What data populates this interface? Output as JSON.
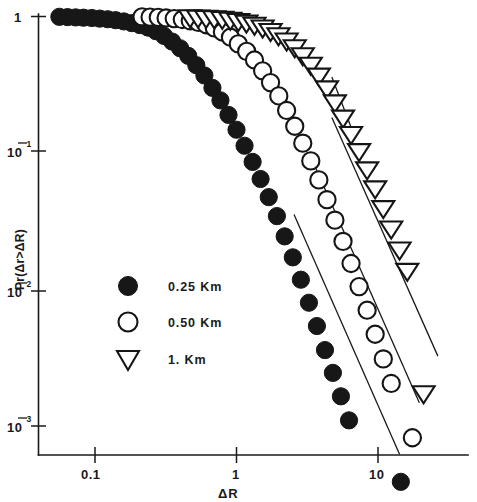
{
  "chart_data": {
    "type": "scatter",
    "title": "",
    "subtitle": "",
    "xlabel": "ΔR",
    "ylabel": "Pr(Δr>ΔR)",
    "xscale": "log",
    "yscale": "log",
    "xlim": [
      0.05,
      30
    ],
    "ylim": [
      0.001,
      1.2
    ],
    "xticks": [
      0.1,
      1,
      10
    ],
    "xtick_labels": [
      "0.1",
      "1",
      "10"
    ],
    "yticks": [
      1,
      0.1,
      0.01,
      0.001
    ],
    "ytick_labels": [
      "1",
      "10⁻¹",
      "10⁻²",
      "10⁻³"
    ],
    "ytick_bases": [
      "1",
      "10",
      "10",
      "10"
    ],
    "ytick_exponents": [
      "",
      "-1",
      "-2",
      "-3"
    ],
    "grid": false,
    "legend_position": "center-left",
    "legend": [
      "0.25 Km",
      "0.50 Km",
      "1. Km"
    ],
    "series": [
      {
        "name": "0.25 Km",
        "marker": "filled-circle",
        "color": "#171717",
        "points": [
          [
            0.056,
            0.995
          ],
          [
            0.064,
            0.99
          ],
          [
            0.073,
            0.985
          ],
          [
            0.083,
            0.98
          ],
          [
            0.095,
            0.975
          ],
          [
            0.108,
            0.965
          ],
          [
            0.123,
            0.955
          ],
          [
            0.14,
            0.94
          ],
          [
            0.16,
            0.92
          ],
          [
            0.182,
            0.895
          ],
          [
            0.208,
            0.865
          ],
          [
            0.237,
            0.83
          ],
          [
            0.27,
            0.78
          ],
          [
            0.308,
            0.72
          ],
          [
            0.351,
            0.655
          ],
          [
            0.4,
            0.585
          ],
          [
            0.456,
            0.515
          ],
          [
            0.52,
            0.44
          ],
          [
            0.593,
            0.37
          ],
          [
            0.676,
            0.3
          ],
          [
            0.77,
            0.243
          ],
          [
            0.878,
            0.19
          ],
          [
            1.0,
            0.148
          ],
          [
            1.14,
            0.113
          ],
          [
            1.3,
            0.086
          ],
          [
            1.48,
            0.0645
          ],
          [
            1.69,
            0.0475
          ],
          [
            1.93,
            0.0345
          ],
          [
            2.19,
            0.0245
          ],
          [
            2.5,
            0.0172
          ],
          [
            2.85,
            0.0118
          ],
          [
            3.25,
            0.008
          ],
          [
            3.7,
            0.0054
          ],
          [
            4.22,
            0.0036
          ],
          [
            4.8,
            0.00245
          ],
          [
            5.47,
            0.00165
          ],
          [
            6.24,
            0.0011
          ],
          [
            14.5,
            0.00039
          ]
        ]
      },
      {
        "name": "0.50 Km",
        "marker": "open-circle",
        "color": "#151515",
        "points": [
          [
            0.215,
            0.995
          ],
          [
            0.245,
            0.99
          ],
          [
            0.28,
            0.985
          ],
          [
            0.318,
            0.975
          ],
          [
            0.363,
            0.965
          ],
          [
            0.414,
            0.95
          ],
          [
            0.471,
            0.93
          ],
          [
            0.537,
            0.905
          ],
          [
            0.612,
            0.87
          ],
          [
            0.697,
            0.825
          ],
          [
            0.795,
            0.77
          ],
          [
            0.906,
            0.705
          ],
          [
            1.03,
            0.63
          ],
          [
            1.18,
            0.555
          ],
          [
            1.34,
            0.48
          ],
          [
            1.53,
            0.4
          ],
          [
            1.74,
            0.328
          ],
          [
            1.99,
            0.262
          ],
          [
            2.26,
            0.205
          ],
          [
            2.58,
            0.157
          ],
          [
            2.94,
            0.118
          ],
          [
            3.35,
            0.0875
          ],
          [
            3.82,
            0.0635
          ],
          [
            4.36,
            0.0455
          ],
          [
            4.96,
            0.0322
          ],
          [
            5.66,
            0.0225
          ],
          [
            6.45,
            0.0155
          ],
          [
            7.35,
            0.0105
          ],
          [
            8.38,
            0.00705
          ],
          [
            9.55,
            0.0047
          ],
          [
            10.9,
            0.0031
          ],
          [
            12.4,
            0.00205
          ],
          [
            17.5,
            0.00082
          ]
        ]
      },
      {
        "name": "1. Km",
        "marker": "open-triangle-down",
        "color": "#151515",
        "points": [
          [
            0.47,
            0.995
          ],
          [
            0.535,
            0.99
          ],
          [
            0.61,
            0.985
          ],
          [
            0.696,
            0.978
          ],
          [
            0.793,
            0.968
          ],
          [
            0.904,
            0.955
          ],
          [
            1.03,
            0.935
          ],
          [
            1.175,
            0.91
          ],
          [
            1.34,
            0.878
          ],
          [
            1.53,
            0.838
          ],
          [
            1.74,
            0.79
          ],
          [
            1.98,
            0.735
          ],
          [
            2.26,
            0.672
          ],
          [
            2.58,
            0.6
          ],
          [
            2.94,
            0.524
          ],
          [
            3.35,
            0.447
          ],
          [
            3.82,
            0.372
          ],
          [
            4.36,
            0.3
          ],
          [
            4.96,
            0.237
          ],
          [
            5.66,
            0.183
          ],
          [
            6.45,
            0.139
          ],
          [
            7.35,
            0.104
          ],
          [
            8.38,
            0.0765
          ],
          [
            9.55,
            0.0555
          ],
          [
            10.9,
            0.0398
          ],
          [
            12.4,
            0.0282
          ],
          [
            14.2,
            0.0198
          ],
          [
            16.1,
            0.0138
          ],
          [
            21.0,
            0.00175
          ]
        ]
      }
    ],
    "fit_lines": [
      {
        "name": "fit-0.25",
        "x1": 2.55,
        "y1": 0.0355,
        "x2": 14.2,
        "y2": 0.00062
      },
      {
        "name": "fit-0.50",
        "x1": 3.52,
        "y1": 0.0835,
        "x2": 19.6,
        "y2": 0.00148
      },
      {
        "name": "fit-1.0",
        "x1": 4.72,
        "y1": 0.182,
        "x2": 26.5,
        "y2": 0.00325
      },
      {
        "name": "fit-upper-cap",
        "x1": 4.72,
        "y1": 0.36,
        "x2": 6.55,
        "y2": 0.148
      }
    ]
  },
  "legend_items": [
    {
      "marker": "filled-circle",
      "label": "0.25 Km",
      "value_text": "0.25",
      "unit": "Km"
    },
    {
      "marker": "open-circle",
      "label": "0.50 Km",
      "value_text": "0.50",
      "unit": "Km"
    },
    {
      "marker": "open-triangle-down",
      "label": "1. Km",
      "value_text": "1.",
      "unit": "Km"
    }
  ],
  "axes": {
    "x_label": "ΔR",
    "y_label": "Pr(Δr>ΔR)",
    "x_tick_labels": [
      "0.1",
      "1",
      "10"
    ],
    "y_tick_labels": [
      "1",
      "10",
      "10",
      "10"
    ],
    "y_tick_exponents": [
      "",
      "1",
      "2",
      "3"
    ]
  },
  "colors": {
    "ink": "#1a1a1a",
    "marker_fill": "#171717",
    "background": "#ffffff"
  }
}
